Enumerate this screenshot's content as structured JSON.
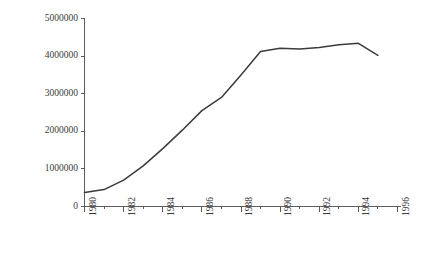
{
  "chart_data": {
    "type": "line",
    "title": "",
    "xlabel": "",
    "ylabel": "Ethanol-compatible vehicles",
    "xlim": [
      1980,
      1996
    ],
    "ylim": [
      0,
      5000000
    ],
    "grid": false,
    "legend": null,
    "x_tick_labels": [
      "1980",
      "1982",
      "1984",
      "1986",
      "1988",
      "1990",
      "1992",
      "1994",
      "1996"
    ],
    "x_tick_values": [
      1980,
      1982,
      1984,
      1986,
      1988,
      1990,
      1992,
      1994,
      1996
    ],
    "x_minor_tick_values": [
      1981,
      1983,
      1985,
      1987,
      1989,
      1991,
      1993,
      1995
    ],
    "y_tick_labels": [
      "0",
      "1000000",
      "2000000",
      "3000000",
      "4000000",
      "5000000"
    ],
    "y_tick_values": [
      0,
      1000000,
      2000000,
      3000000,
      4000000,
      5000000
    ],
    "series": [
      {
        "name": "Ethanol-compatible vehicles",
        "color": "#3b3b3b",
        "x": [
          1980,
          1981,
          1982,
          1983,
          1984,
          1985,
          1986,
          1987,
          1988,
          1989,
          1990,
          1991,
          1992,
          1993,
          1994,
          1995
        ],
        "values": [
          370000,
          450000,
          700000,
          1080000,
          1540000,
          2030000,
          2550000,
          2900000,
          3500000,
          4120000,
          4210000,
          4190000,
          4230000,
          4300000,
          4340000,
          4020000
        ]
      }
    ]
  },
  "axes": {
    "y_axis_name": "y-axis",
    "x_axis_name": "x-axis"
  }
}
